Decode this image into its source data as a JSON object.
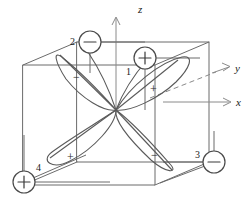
{
  "figure": {
    "background_color": "#ffffff",
    "line_color": "#6b6b6b",
    "lobe_color": "#5a5a5a",
    "axis_color": "#8a8a8a",
    "width": 249,
    "height": 203
  },
  "axes": [
    {
      "name": "z-axis",
      "label": "z",
      "direction": "up",
      "style": "solid-arrow",
      "label_x": 138,
      "label_y": 12
    },
    {
      "name": "y-axis",
      "label": "y",
      "direction": "up-right-diagonal",
      "style": "dashed-then-solid-arrow",
      "label_x": 236,
      "label_y": 80
    },
    {
      "name": "x-axis",
      "label": "x",
      "direction": "right",
      "style": "solid-arrow",
      "label_x": 237,
      "label_y": 114
    }
  ],
  "nodes": [
    {
      "id": "node-1",
      "index": "1",
      "sign": "+",
      "cx": 145,
      "cy": 58,
      "r": 11,
      "index_x": 128,
      "index_y": 72
    },
    {
      "id": "node-2",
      "index": "2",
      "sign": "−",
      "cx": 90,
      "cy": 42,
      "r": 11,
      "index_x": 72,
      "index_y": 42
    },
    {
      "id": "node-3",
      "index": "3",
      "sign": "−",
      "cx": 214,
      "cy": 162,
      "r": 11,
      "index_x": 196,
      "index_y": 158
    },
    {
      "id": "node-4",
      "index": "4",
      "sign": "+",
      "cx": 24,
      "cy": 182,
      "r": 11,
      "index_x": 38,
      "index_y": 168
    }
  ],
  "lobes": [
    {
      "id": "lobe-1",
      "sign": "+",
      "points_to": "node-1",
      "sign_x": 153,
      "sign_y": 88,
      "quadrant": "upper-right"
    },
    {
      "id": "lobe-2",
      "sign": "−",
      "points_to": "node-2",
      "sign_x": 77,
      "sign_y": 76,
      "quadrant": "upper-left"
    },
    {
      "id": "lobe-3",
      "sign": "−",
      "points_to": "node-3",
      "sign_x": 155,
      "sign_y": 155,
      "quadrant": "lower-right"
    },
    {
      "id": "lobe-4",
      "sign": "+",
      "points_to": "node-4",
      "sign_x": 72,
      "sign_y": 156,
      "quadrant": "lower-left"
    }
  ],
  "center": {
    "name": "orbital-origin",
    "x": 116,
    "y": 110
  },
  "cube": {
    "name": "bounding-cube",
    "front_face": [
      [
        23,
        65
      ],
      [
        23,
        185
      ],
      [
        155,
        185
      ],
      [
        155,
        65
      ]
    ],
    "back_face": [
      [
        77,
        42
      ],
      [
        77,
        162
      ],
      [
        209,
        162
      ],
      [
        209,
        42
      ]
    ],
    "edge_style": "solid"
  }
}
